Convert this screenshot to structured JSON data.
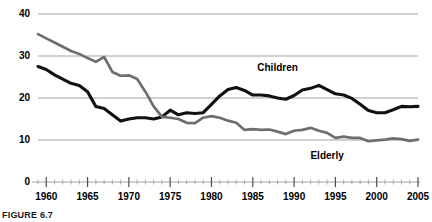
{
  "figure": {
    "caption": "FIGURE 6.7"
  },
  "chart_data": {
    "type": "line",
    "title": "",
    "xlabel": "",
    "ylabel": "",
    "xlim": [
      1959,
      2005
    ],
    "ylim": [
      0,
      40
    ],
    "yticks": [
      0,
      10,
      20,
      30,
      40
    ],
    "xticks": [
      1960,
      1965,
      1970,
      1975,
      1980,
      1985,
      1990,
      1995,
      2000,
      2005
    ],
    "xminor_step": 1,
    "grid": "horizontal",
    "legend_position": "inline-annotations",
    "annotations": [
      {
        "text": "Children",
        "x": 1988,
        "y": 26.5
      },
      {
        "text": "Elderly",
        "x": 1994,
        "y": 5.5
      }
    ],
    "series": [
      {
        "name": "Children",
        "color": "#111111",
        "x": [
          1959,
          1960,
          1961,
          1962,
          1963,
          1964,
          1965,
          1966,
          1967,
          1968,
          1969,
          1970,
          1971,
          1972,
          1973,
          1974,
          1975,
          1976,
          1977,
          1978,
          1979,
          1980,
          1981,
          1982,
          1983,
          1984,
          1985,
          1986,
          1987,
          1988,
          1989,
          1990,
          1991,
          1992,
          1993,
          1994,
          1995,
          1996,
          1997,
          1998,
          1999,
          2000,
          2001,
          2002,
          2003,
          2004,
          2005
        ],
        "values": [
          27.5,
          26.8,
          25.5,
          24.5,
          23.5,
          23.0,
          21.5,
          18.0,
          17.5,
          16.0,
          14.5,
          15.0,
          15.3,
          15.3,
          15.0,
          15.5,
          17.1,
          16.0,
          16.5,
          16.3,
          16.5,
          18.5,
          20.5,
          22.0,
          22.5,
          21.8,
          20.7,
          20.7,
          20.5,
          20.0,
          19.7,
          20.6,
          21.9,
          22.3,
          23.0,
          22.0,
          21.0,
          20.7,
          19.9,
          18.5,
          17.0,
          16.5,
          16.5,
          17.2,
          18.0,
          17.9,
          18.0
        ]
      },
      {
        "name": "Elderly",
        "color": "#6e6e6e",
        "x": [
          1959,
          1960,
          1961,
          1962,
          1963,
          1964,
          1965,
          1966,
          1967,
          1968,
          1969,
          1970,
          1971,
          1972,
          1973,
          1974,
          1975,
          1976,
          1977,
          1978,
          1979,
          1980,
          1981,
          1982,
          1983,
          1984,
          1985,
          1986,
          1987,
          1988,
          1989,
          1990,
          1991,
          1992,
          1993,
          1994,
          1995,
          1996,
          1997,
          1998,
          1999,
          2000,
          2001,
          2002,
          2003,
          2004,
          2005
        ],
        "values": [
          35.2,
          34.2,
          33.2,
          32.2,
          31.2,
          30.5,
          29.5,
          28.6,
          29.8,
          26.2,
          25.3,
          25.4,
          24.5,
          21.5,
          18.0,
          15.5,
          15.3,
          15.0,
          14.1,
          14.0,
          15.3,
          15.7,
          15.3,
          14.6,
          14.1,
          12.4,
          12.6,
          12.4,
          12.5,
          12.0,
          11.4,
          12.2,
          12.4,
          12.9,
          12.2,
          11.7,
          10.5,
          10.8,
          10.5,
          10.5,
          9.7,
          9.9,
          10.1,
          10.4,
          10.2,
          9.8,
          10.1
        ]
      }
    ]
  }
}
